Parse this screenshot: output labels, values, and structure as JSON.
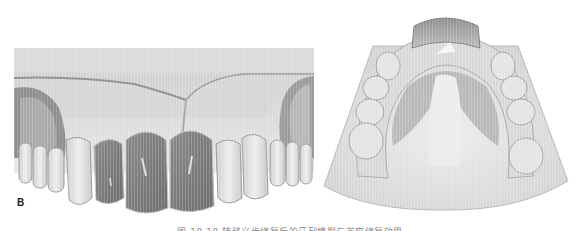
{
  "figure": {
    "panels": [
      {
        "id": "B",
        "label": "B",
        "description": "Frontal view of maxillary dental model with three dark anterior crowns (central and lateral incisors)"
      },
      {
        "id": "C",
        "label": "",
        "description": "Occlusal view of maxillary dental cast with palatal plate across the anterior arch"
      }
    ],
    "caption": "图 18-18 转移义齿修复后的牙列模型与美容修复效果",
    "caption_note": "caption is clipped at the bottom edge of the image and only partially visible"
  },
  "colors": {
    "background": "#ffffff",
    "model_light": "#e6e6e6",
    "model_mid": "#c4c4c4",
    "gum_shadow": "#8f8f8f",
    "crown_dark": "#7c7c7c",
    "palate_plate": "#a8a8a8"
  }
}
